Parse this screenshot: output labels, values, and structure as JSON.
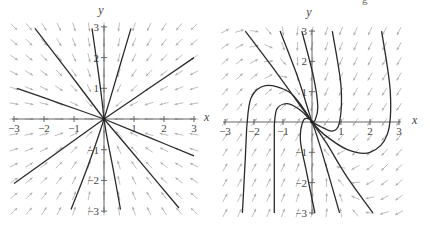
{
  "chart_data": [
    {
      "type": "line",
      "subtype": "phase-portrait",
      "title": "",
      "xlabel": "x",
      "ylabel": "y",
      "xlim": [
        -3,
        3
      ],
      "ylim": [
        -3,
        3
      ],
      "x_ticks": [
        -3,
        -2,
        -1,
        1,
        2,
        3
      ],
      "y_ticks": [
        3,
        2,
        1,
        -1,
        -2,
        -3
      ],
      "x_tick_labels": [
        "−3",
        "−2",
        "−1",
        "1",
        "2",
        "3"
      ],
      "y_tick_labels": [
        "3",
        "2",
        "1",
        "−1",
        "−2",
        "−3"
      ],
      "grid": false,
      "legend": null,
      "description": "Direction field (gray arrows pointing toward origin) with solution curves converging to the origin (stable node).",
      "equilibrium": [
        0,
        0
      ],
      "vector_field": "toward origin",
      "series": [
        {
          "name": "trajectory-1",
          "points": [
            [
              -2.9,
              1.0
            ],
            [
              -1.5,
              0.52
            ],
            [
              0,
              0
            ]
          ]
        },
        {
          "name": "trajectory-2",
          "points": [
            [
              -2.3,
              2.95
            ],
            [
              -1.2,
              1.55
            ],
            [
              0,
              0
            ]
          ]
        },
        {
          "name": "trajectory-3",
          "points": [
            [
              -0.4,
              2.95
            ],
            [
              -0.2,
              1.6
            ],
            [
              -0.08,
              0.7
            ],
            [
              0,
              0
            ]
          ]
        },
        {
          "name": "trajectory-4",
          "points": [
            [
              0.9,
              2.95
            ],
            [
              0.55,
              1.8
            ],
            [
              0.25,
              0.8
            ],
            [
              0,
              0
            ]
          ]
        },
        {
          "name": "trajectory-5",
          "points": [
            [
              3.0,
              2.0
            ],
            [
              1.5,
              1.0
            ],
            [
              0,
              0
            ]
          ]
        },
        {
          "name": "trajectory-6",
          "points": [
            [
              3.0,
              -1.2
            ],
            [
              1.5,
              -0.6
            ],
            [
              0,
              0
            ]
          ]
        },
        {
          "name": "trajectory-7",
          "points": [
            [
              2.5,
              -2.9
            ],
            [
              1.3,
              -1.5
            ],
            [
              0,
              0
            ]
          ]
        },
        {
          "name": "trajectory-8",
          "points": [
            [
              0.55,
              -2.95
            ],
            [
              0.3,
              -1.6
            ],
            [
              0.1,
              -0.6
            ],
            [
              0,
              0
            ]
          ]
        },
        {
          "name": "trajectory-9",
          "points": [
            [
              -1.1,
              -2.95
            ],
            [
              -0.6,
              -1.7
            ],
            [
              -0.2,
              -0.6
            ],
            [
              0,
              0
            ]
          ]
        },
        {
          "name": "trajectory-10",
          "points": [
            [
              -3.0,
              -2.1
            ],
            [
              -1.5,
              -1.05
            ],
            [
              0,
              0
            ]
          ]
        }
      ]
    },
    {
      "type": "line",
      "subtype": "phase-portrait",
      "title": "",
      "xlabel": "x",
      "ylabel": "y",
      "xlim": [
        -3,
        3
      ],
      "ylim": [
        -3,
        3
      ],
      "x_ticks": [
        -3,
        -2,
        -1,
        1,
        2,
        3
      ],
      "y_ticks": [
        3,
        2,
        1,
        -1,
        -2,
        -3
      ],
      "x_tick_labels": [
        "−3",
        "−2",
        "−1",
        "1",
        "2",
        "3"
      ],
      "y_tick_labels": [
        "3",
        "2",
        "1",
        "−1",
        "−2",
        "−3"
      ],
      "grid": false,
      "legend": null,
      "description": "Direction field with solution curves approaching the origin along a single eigen-direction (degenerate node); arrows point upward on the left, downward on the right.",
      "equilibrium": [
        0,
        0
      ],
      "series": [
        {
          "name": "trajectory-1",
          "points": [
            [
              -2.3,
              3.0
            ],
            [
              -1.2,
              1.6
            ],
            [
              -0.3,
              0.4
            ],
            [
              0,
              0
            ]
          ]
        },
        {
          "name": "trajectory-2",
          "points": [
            [
              -1.1,
              3.0
            ],
            [
              -0.5,
              1.5
            ],
            [
              -0.1,
              0.3
            ],
            [
              0,
              0
            ]
          ]
        },
        {
          "name": "trajectory-3",
          "points": [
            [
              -0.35,
              3.0
            ],
            [
              0.05,
              1.5
            ],
            [
              0.2,
              0.5
            ],
            [
              0.1,
              0.05
            ],
            [
              0,
              0
            ]
          ]
        },
        {
          "name": "trajectory-4",
          "points": [
            [
              2.4,
              3.0
            ],
            [
              2.7,
              1.0
            ],
            [
              2.6,
              -0.4
            ],
            [
              2.0,
              -1.0
            ],
            [
              1.2,
              -0.9
            ],
            [
              0.4,
              -0.4
            ],
            [
              0,
              0
            ]
          ]
        },
        {
          "name": "trajectory-5",
          "points": [
            [
              0.7,
              3.0
            ],
            [
              1.0,
              1.2
            ],
            [
              0.95,
              0.0
            ],
            [
              0.7,
              -0.3
            ],
            [
              0.3,
              -0.15
            ],
            [
              0,
              0
            ]
          ]
        },
        {
          "name": "trajectory-6",
          "points": [
            [
              -2.25,
              -0.15
            ],
            [
              -2.1,
              0.8
            ],
            [
              -1.6,
              1.2
            ],
            [
              -0.8,
              1.0
            ],
            [
              -0.3,
              0.45
            ],
            [
              0,
              0
            ]
          ]
        },
        {
          "name": "trajectory-7",
          "points": [
            [
              -1.3,
              -0.1
            ],
            [
              -1.2,
              0.45
            ],
            [
              -0.8,
              0.6
            ],
            [
              -0.35,
              0.35
            ],
            [
              0,
              0
            ]
          ]
        },
        {
          "name": "trajectory-8",
          "points": [
            [
              -2.4,
              -3.0
            ],
            [
              -2.3,
              -1.2
            ],
            [
              -2.25,
              -0.15
            ]
          ]
        },
        {
          "name": "trajectory-9",
          "points": [
            [
              -1.3,
              -3.0
            ],
            [
              -1.3,
              -1.2
            ],
            [
              -1.3,
              -0.1
            ]
          ]
        },
        {
          "name": "trajectory-10",
          "points": [
            [
              0.1,
              -3.0
            ],
            [
              -0.2,
              -1.6
            ],
            [
              -0.4,
              -0.6
            ],
            [
              -0.3,
              0.05
            ],
            [
              -0.1,
              0.1
            ],
            [
              0,
              0
            ]
          ]
        },
        {
          "name": "trajectory-11",
          "points": [
            [
              0.95,
              -3.0
            ],
            [
              0.5,
              -1.5
            ],
            [
              0.15,
              -0.4
            ],
            [
              0,
              0
            ]
          ]
        },
        {
          "name": "trajectory-12",
          "points": [
            [
              2.1,
              -3.0
            ],
            [
              1.2,
              -1.8
            ],
            [
              0.5,
              -0.7
            ],
            [
              0,
              0
            ]
          ]
        }
      ]
    }
  ],
  "figure": {
    "corner_mark": "g"
  }
}
